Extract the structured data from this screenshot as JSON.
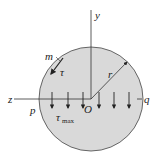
{
  "diagram": {
    "labels": {
      "y_axis": "y",
      "z_axis": "z",
      "origin": "O",
      "radius": "r",
      "point_m": "m",
      "tau": "τ",
      "point_p": "p",
      "point_q": "q",
      "tau_max": "τ",
      "tau_max_sub": "max"
    },
    "colors": {
      "fill": "#d9d9d9",
      "stroke": "#333333"
    }
  }
}
